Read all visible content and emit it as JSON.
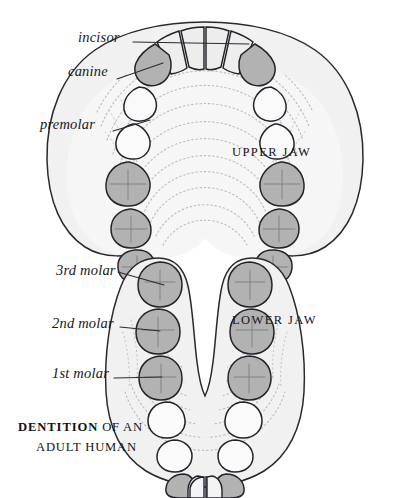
{
  "figure": {
    "title_caption": {
      "bold_part": "DENTITION",
      "rest_part": " OF AN",
      "line2": "ADULT HUMAN"
    },
    "jaws": [
      {
        "id": "upper",
        "name": "UPPER JAW"
      },
      {
        "id": "lower",
        "name": "LOWER JAW"
      }
    ],
    "labels": [
      {
        "id": "incisor",
        "text": "incisor"
      },
      {
        "id": "canine",
        "text": "canine"
      },
      {
        "id": "premolar",
        "text": "premolar"
      },
      {
        "id": "molar3",
        "text": "3rd molar"
      },
      {
        "id": "molar2",
        "text": "2nd molar"
      },
      {
        "id": "molar1",
        "text": "1st molar"
      }
    ],
    "colors": {
      "background": "#ffffff",
      "ink": "#1a1a1f",
      "gum": "#f1f1f1",
      "gum_edge": "#2a2a2e",
      "tooth_light": "#f7f7f7",
      "tooth_incisor": "#ededed",
      "tooth_shaded": "#b2b2b2",
      "texture": "#b9b9bd",
      "leader": "#2b2b30"
    },
    "tooth_groups": {
      "incisor": "light",
      "canine": "shaded",
      "premolar": "light",
      "molar": "shaded"
    }
  }
}
